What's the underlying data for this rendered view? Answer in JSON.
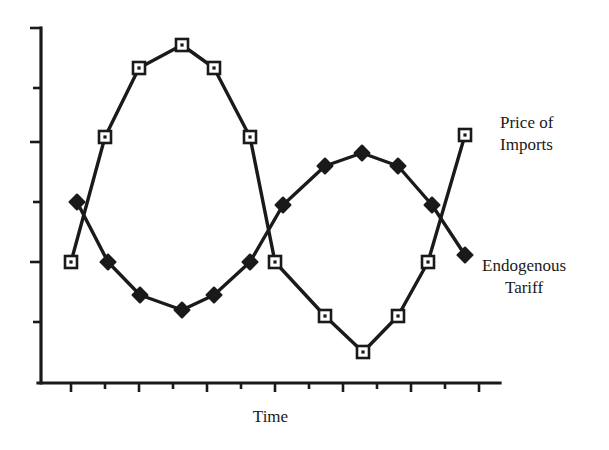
{
  "figure": {
    "background_color": "#ffffff",
    "ink_color": "#1a1a1a"
  },
  "axes": {
    "x_axis_label": "Time",
    "y_axis_label": "",
    "x_tick_count": 13,
    "y_tick_count": 6,
    "x_axis_line": {
      "x1": 41,
      "y1": 383,
      "x2": 500,
      "y2": 383
    },
    "y_axis_line": {
      "x1": 41,
      "y1": 28,
      "x2": 41,
      "y2": 383
    },
    "x_tick_positions": [
      71,
      105,
      139,
      173,
      207,
      241,
      275,
      309,
      343,
      377,
      411,
      445,
      479
    ],
    "x_tick_lengths": [
      10,
      7,
      10,
      7,
      10,
      7,
      10,
      7,
      10,
      7,
      10,
      7,
      10
    ],
    "y_tick_positions": [
      28,
      88,
      142,
      202,
      262,
      322
    ],
    "y_tick_lengths": [
      12,
      9,
      12,
      9,
      12,
      9
    ]
  },
  "labels": {
    "price_of_imports": "Price of\nImports",
    "endogenous_tariff": "Endogenous\nTariff"
  },
  "chart_data": {
    "type": "line",
    "title": "",
    "xlabel": "Time",
    "ylabel": "",
    "grid": false,
    "legend_position": "right-inline-annotations",
    "xlim": [
      0,
      12
    ],
    "ylim": [
      0,
      10
    ],
    "x": [
      0,
      1,
      2,
      3,
      4,
      5,
      6,
      7,
      8,
      9,
      10,
      11,
      12
    ],
    "series": [
      {
        "name": "Price of Imports",
        "marker": "open-square",
        "marker_fill": "#ffffff",
        "line_color": "#1a1a1a",
        "values": [
          3.4,
          6.6,
          8.9,
          9.7,
          8.9,
          6.6,
          3.4,
          1.1,
          0.3,
          1.1,
          3.4,
          6.6,
          8.9
        ],
        "pixel_points": [
          [
            71,
            262
          ],
          [
            105,
            137
          ],
          [
            139,
            68
          ],
          [
            182,
            45
          ],
          [
            214,
            68
          ],
          [
            250,
            137
          ],
          [
            275,
            262
          ],
          [
            325,
            316
          ],
          [
            363,
            352
          ],
          [
            398,
            316
          ],
          [
            428,
            262
          ],
          [
            465,
            135
          ]
        ]
      },
      {
        "name": "Endogenous Tariff",
        "marker": "filled-diamond",
        "marker_fill": "#1a1a1a",
        "line_color": "#1a1a1a",
        "values": [
          5.1,
          3.4,
          2.3,
          2.0,
          2.3,
          3.4,
          5.1,
          6.8,
          7.7,
          8.0,
          7.7,
          6.8,
          5.1
        ],
        "pixel_points": [
          [
            77,
            202
          ],
          [
            108,
            262
          ],
          [
            140,
            295
          ],
          [
            182,
            310
          ],
          [
            214,
            295
          ],
          [
            250,
            262
          ],
          [
            283,
            205
          ],
          [
            325,
            166
          ],
          [
            362,
            153
          ],
          [
            398,
            166
          ],
          [
            432,
            205
          ],
          [
            465,
            255
          ]
        ]
      }
    ]
  }
}
